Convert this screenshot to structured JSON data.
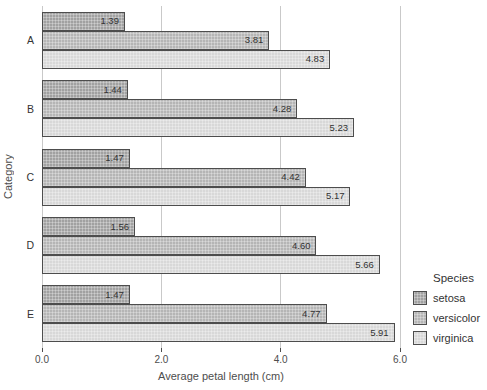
{
  "chart_data": {
    "type": "bar",
    "orientation": "horizontal",
    "xlabel": "Average petal length (cm)",
    "ylabel": "Category",
    "categories": [
      "A",
      "B",
      "C",
      "D",
      "E"
    ],
    "series": [
      {
        "name": "setosa",
        "color": "#a1a1a1",
        "values": [
          1.39,
          1.44,
          1.47,
          1.56,
          1.47
        ]
      },
      {
        "name": "versicolor",
        "color": "#b5b5b5",
        "values": [
          3.81,
          4.28,
          4.42,
          4.6,
          4.77
        ]
      },
      {
        "name": "virginica",
        "color": "#d8d8d8",
        "values": [
          4.83,
          5.23,
          5.17,
          5.66,
          5.91
        ]
      }
    ],
    "xlim": [
      0,
      6
    ],
    "xticks": [
      0,
      2,
      4,
      6
    ],
    "xtick_labels": [
      "0.0",
      "2.0",
      "4.0",
      "6.0"
    ],
    "legend": {
      "title": "Species",
      "position": "right"
    },
    "grid": true,
    "bar_border_color": "#4d4d4d",
    "gridline_color": "#c9c9c9",
    "text_color": "#333333"
  }
}
